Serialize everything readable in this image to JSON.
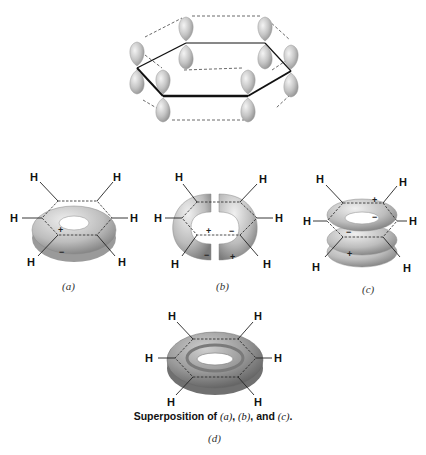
{
  "figure": {
    "top_diagram": {
      "description": "six p orbitals on hexagonal benzene ring with dashed overlap lines",
      "orbital_count": 6
    },
    "panels": [
      {
        "id": "a",
        "label": "(a)",
        "signs": [
          "+",
          "−"
        ],
        "atoms": [
          "H",
          "H",
          "H",
          "H",
          "H",
          "H"
        ]
      },
      {
        "id": "b",
        "label": "(b)",
        "signs": [
          "+",
          "−",
          "−",
          "+"
        ],
        "atoms": [
          "H",
          "H",
          "H",
          "H",
          "H",
          "H"
        ]
      },
      {
        "id": "c",
        "label": "(c)",
        "signs": [
          "+",
          "−",
          "−",
          "+"
        ],
        "atoms": [
          "H",
          "H",
          "H",
          "H",
          "H",
          "H"
        ]
      },
      {
        "id": "d",
        "label": "(d)",
        "atoms": [
          "H",
          "H",
          "H",
          "H",
          "H",
          "H"
        ]
      }
    ],
    "caption": {
      "prefix": "Superposition of ",
      "a": "(a)",
      "sep1": ", ",
      "b": "(b)",
      "sep2": ", and ",
      "c": "(c)",
      "suffix": "."
    },
    "colors": {
      "lobe": "#c8c8c8",
      "lobe_dark": "#8f8f8f",
      "torus_light": "#d6d6d6",
      "torus_dark": "#7c7c7c",
      "bond": "#111111"
    }
  }
}
